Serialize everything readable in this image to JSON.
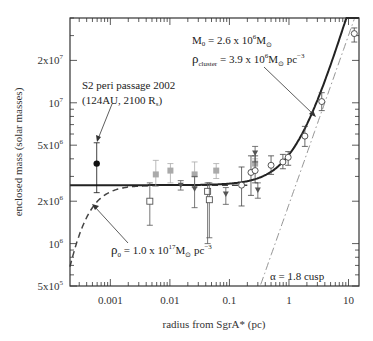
{
  "chart_data": {
    "type": "scatter",
    "title": "",
    "xlabel": "radius from SgrA* (pc)",
    "ylabel": "enclosed mass (solar masses)",
    "xscale": "log",
    "yscale": "log",
    "xlim": [
      0.00021,
      15
    ],
    "ylim": [
      500000,
      40000000
    ],
    "grid": false,
    "x_ticks": [
      {
        "value": 0.001,
        "label": "0.001"
      },
      {
        "value": 0.01,
        "label": "0.01"
      },
      {
        "value": 0.1,
        "label": "0.1"
      },
      {
        "value": 1,
        "label": "1"
      },
      {
        "value": 10,
        "label": "10"
      }
    ],
    "y_ticks": [
      {
        "value": 500000,
        "base": "5x10",
        "exp": "5"
      },
      {
        "value": 1000000,
        "base": "10",
        "exp": "6"
      },
      {
        "value": 2000000,
        "base": "2x10",
        "exp": "6"
      },
      {
        "value": 5000000,
        "base": "5x10",
        "exp": "6"
      },
      {
        "value": 10000000,
        "base": "10",
        "exp": "7"
      },
      {
        "value": 20000000,
        "base": "2x10",
        "exp": "7"
      }
    ],
    "series": [
      {
        "name": "S2 peri passage",
        "marker": "filled-circle",
        "color": "#111111",
        "points": [
          {
            "x": 0.00059,
            "y": 3700000,
            "ylo": 2300000,
            "yhi": 5200000
          }
        ]
      },
      {
        "name": "open squares",
        "marker": "open-square",
        "color": "#555555",
        "points": [
          {
            "x": 0.0046,
            "y": 2000000,
            "ylo": 1350000,
            "yhi": 2700000
          },
          {
            "x": 0.043,
            "y": 2350000,
            "ylo": 1000000,
            "yhi": 2700000
          },
          {
            "x": 0.046,
            "y": 2050000,
            "ylo": 1100000,
            "yhi": 2700000
          }
        ]
      },
      {
        "name": "grey filled squares",
        "marker": "filled-square",
        "color": "#aaaaaa",
        "points": [
          {
            "x": 0.0058,
            "y": 3100000,
            "ylo": 2550000,
            "yhi": 3900000
          },
          {
            "x": 0.0102,
            "y": 3300000,
            "ylo": 2700000,
            "yhi": 3700000
          },
          {
            "x": 0.026,
            "y": 3100000,
            "ylo": 2500000,
            "yhi": 3800000
          },
          {
            "x": 0.06,
            "y": 3300000,
            "ylo": 2900000,
            "yhi": 3700000
          },
          {
            "x": 0.27,
            "y": 3700000,
            "ylo": 3300000,
            "yhi": 4000000
          }
        ]
      },
      {
        "name": "filled triangles",
        "marker": "filled-triangle",
        "color": "#555555",
        "points": [
          {
            "x": 0.0152,
            "y": 2600000,
            "ylo": 2400000,
            "yhi": 2800000
          },
          {
            "x": 0.026,
            "y": 2450000,
            "ylo": 1800000,
            "yhi": 3000000
          },
          {
            "x": 0.087,
            "y": 2250000,
            "ylo": 1900000,
            "yhi": 2500000
          },
          {
            "x": 0.27,
            "y": 4400000,
            "ylo": 3800000,
            "yhi": 4900000
          },
          {
            "x": 0.3,
            "y": 2400000,
            "ylo": 2100000,
            "yhi": 2700000
          }
        ]
      },
      {
        "name": "open circles",
        "marker": "open-circle",
        "color": "#444444",
        "points": [
          {
            "x": 0.16,
            "y": 2600000,
            "ylo": 1850000,
            "yhi": 3500000
          },
          {
            "x": 0.23,
            "y": 3200000,
            "ylo": 2200000,
            "yhi": 4200000
          },
          {
            "x": 0.27,
            "y": 3300000,
            "ylo": 2700000,
            "yhi": 4200000
          },
          {
            "x": 0.5,
            "y": 3600000,
            "ylo": 3100000,
            "yhi": 4200000
          },
          {
            "x": 0.79,
            "y": 3800000,
            "ylo": 3400000,
            "yhi": 4300000
          },
          {
            "x": 0.97,
            "y": 4100000,
            "ylo": 3600000,
            "yhi": 4500000
          },
          {
            "x": 1.85,
            "y": 5800000,
            "ylo": 4900000,
            "yhi": 6800000
          },
          {
            "x": 3.55,
            "y": 10200000,
            "ylo": 8800000,
            "yhi": 11800000
          },
          {
            "x": 12.5,
            "y": 31000000,
            "ylo": 27000000,
            "yhi": 34000000
          }
        ]
      }
    ],
    "curves": [
      {
        "name": "Point mass + cluster model",
        "style": "solid-thick",
        "color": "#222222"
      },
      {
        "name": "Dark cluster with rho0 (Plummer)",
        "style": "dashed",
        "color": "#444444"
      },
      {
        "name": "alpha = 1.8 cusp",
        "style": "dash-dot",
        "color": "#888888"
      }
    ],
    "annotations": [
      {
        "text": "S2 peri passage 2002",
        "x": 0.001,
        "y": 10000000
      },
      {
        "text": "(124AU, 2100 R_s)",
        "x": 0.001,
        "y": 8500000
      },
      {
        "text": "M_0 = 2.6 x 10^6 M_sun",
        "x": 0.03,
        "y": 30000000
      },
      {
        "text": "rho_cluster = 3.9 x 10^6 M_sun pc^-3",
        "x": 0.03,
        "y": 22000000
      },
      {
        "text": "rho_0 = 1.0 x 10^17 M_sun pc^-3",
        "x": 0.002,
        "y": 1000000
      },
      {
        "text": "alpha = 1.8 cusp",
        "x": 1,
        "y": 600000
      }
    ]
  },
  "labels": {
    "xlabel": "radius from SgrA* (pc)",
    "ylabel": "enclosed mass (solar masses)",
    "s2_line1": "S2 peri passage 2002",
    "s2_line2_pre": "(124AU, 2100 R",
    "s2_line2_sub": "s",
    "s2_line2_post": ")",
    "m0_pre": "M",
    "m0_sub": "0",
    "m0_mid": " = 2.6 x 10",
    "m0_exp": "6",
    "m0_unit": "M",
    "rho_cluster_sym": "ρ",
    "rho_cluster_sub": "cluster",
    "rho_cluster_mid": " = 3.9 x 10",
    "rho_cluster_exp": "6",
    "rho_cluster_unit": "M",
    "rho_cluster_pc": " pc",
    "rho_cluster_pcexp": "−3",
    "rho0_sym": "ρ",
    "rho0_sub": "0",
    "rho0_mid": " = 1.0 x 10",
    "rho0_exp": "17",
    "rho0_unit": "M",
    "rho0_pc": " pc",
    "rho0_pcexp": "−3",
    "cusp": "α = 1.8 cusp",
    "sun_symbol": "⊙"
  }
}
